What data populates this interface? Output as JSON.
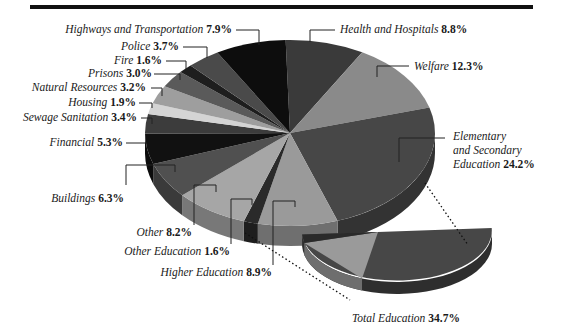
{
  "chart_data": {
    "type": "pie",
    "style": "3d-exploded-with-breakout",
    "title": "",
    "slices": [
      {
        "label": "Health and Hospitals",
        "value": 8.8,
        "color": "#3a3a3a"
      },
      {
        "label": "Welfare",
        "value": 12.3,
        "color": "#8a8a8a"
      },
      {
        "label": "Elementary and Secondary Education",
        "value": 24.2,
        "color": "#474747"
      },
      {
        "label": "Higher Education",
        "value": 8.9,
        "color": "#9a9a9a"
      },
      {
        "label": "Other Education",
        "value": 1.6,
        "color": "#2a2a2a"
      },
      {
        "label": "Other",
        "value": 8.2,
        "color": "#a6a6a6"
      },
      {
        "label": "Buildings",
        "value": 6.3,
        "color": "#505050"
      },
      {
        "label": "Financial",
        "value": 5.3,
        "color": "#111111"
      },
      {
        "label": "Sewage Sanitation",
        "value": 3.4,
        "color": "#3c3c3c"
      },
      {
        "label": "Housing",
        "value": 1.9,
        "color": "#d4d4d4"
      },
      {
        "label": "Natural Resources",
        "value": 3.2,
        "color": "#9e9e9e"
      },
      {
        "label": "Prisons",
        "value": 3.0,
        "color": "#5a5a5a"
      },
      {
        "label": "Fire",
        "value": 1.6,
        "color": "#1e1e1e"
      },
      {
        "label": "Police",
        "value": 3.7,
        "color": "#4a4a4a"
      },
      {
        "label": "Highways and Transportation",
        "value": 7.9,
        "color": "#0d0d0d"
      }
    ],
    "breakout": {
      "label": "Total Education",
      "value": 34.7,
      "components": [
        "Elementary and Secondary Education",
        "Higher Education",
        "Other Education"
      ]
    }
  },
  "labels": {
    "highways": {
      "name": "Highways and Transportation",
      "pct": "7.9%"
    },
    "police": {
      "name": "Police",
      "pct": "3.7%"
    },
    "fire": {
      "name": "Fire",
      "pct": "1.6%"
    },
    "prisons": {
      "name": "Prisons",
      "pct": "3.0%"
    },
    "natural": {
      "name": "Natural Resources",
      "pct": "3.2%"
    },
    "housing": {
      "name": "Housing",
      "pct": "1.9%"
    },
    "sewage": {
      "name": "Sewage Sanitation",
      "pct": "3.4%"
    },
    "financial": {
      "name": "Financial",
      "pct": "5.3%"
    },
    "buildings": {
      "name": "Buildings",
      "pct": "6.3%"
    },
    "other": {
      "name": "Other",
      "pct": "8.2%"
    },
    "other_edu": {
      "name": "Other Education",
      "pct": "1.6%"
    },
    "higher_edu": {
      "name": "Higher Education",
      "pct": "8.9%"
    },
    "health": {
      "name": "Health and Hospitals",
      "pct": "8.8%"
    },
    "welfare": {
      "name": "Welfare",
      "pct": "12.3%"
    },
    "elem_line1": "Elementary",
    "elem_line2": "and Secondary",
    "elem_line3": "Education",
    "elem_pct": "24.2%",
    "total_edu": {
      "name": "Total Education",
      "pct": "34.7%"
    }
  }
}
